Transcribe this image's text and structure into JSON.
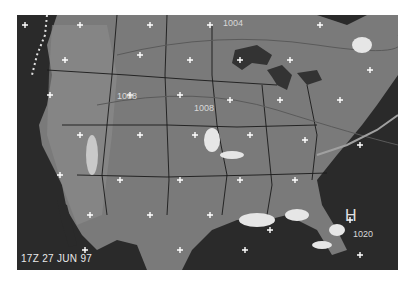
{
  "map": {
    "title": "Weather satellite composite - United States",
    "timestamp": "17Z 27 JUN 97",
    "pressure_centers": [
      {
        "type": "H",
        "label": "H",
        "value": "1020",
        "x": 346,
        "y": 200
      }
    ],
    "isobar_labels": [
      {
        "text": "1004",
        "x": 206,
        "y": 3
      },
      {
        "text": "1008",
        "x": 100,
        "y": 76
      },
      {
        "text": "1008",
        "x": 177,
        "y": 88
      }
    ],
    "colors": {
      "ocean": "#2a2a2a",
      "land": "#7a7a7a",
      "lakes": "#333333",
      "borders": "#1a1a1a",
      "grid_cross": "#ffffff",
      "clouds": "#e6e6e6"
    }
  }
}
